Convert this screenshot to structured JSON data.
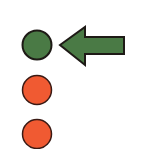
{
  "diagram": {
    "indicators": [
      {
        "state": "active",
        "color": "#4a7a45",
        "cx": 37,
        "cy": 45
      },
      {
        "state": "inactive",
        "color": "#f05a32",
        "cx": 37,
        "cy": 90
      },
      {
        "state": "inactive",
        "color": "#f05a32",
        "cx": 37,
        "cy": 134
      }
    ],
    "arrow": {
      "direction": "left",
      "color": "#4a7a45",
      "points_to": 0
    },
    "outline_color": "#1e1a16",
    "background": "#ffffff"
  }
}
